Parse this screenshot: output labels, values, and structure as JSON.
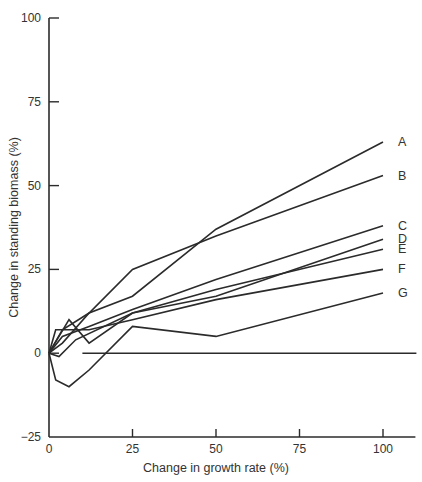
{
  "chart_data": {
    "type": "line",
    "title": "",
    "xlabel": "Change in growth rate (%)",
    "ylabel": "Change in standing biomass (%)",
    "xlim": [
      0,
      110
    ],
    "ylim": [
      -25,
      100
    ],
    "xticks": [
      0,
      25,
      50,
      75,
      100
    ],
    "yticks": [
      -25,
      0,
      25,
      50,
      75,
      100
    ],
    "xtick_labels": [
      "0",
      "25",
      "50",
      "75",
      "100"
    ],
    "ytick_labels": [
      "−25",
      "0",
      "25",
      "50",
      "75",
      "100"
    ],
    "grid": false,
    "legend": "inline-right",
    "series": [
      {
        "name": "A",
        "x": [
          0,
          4,
          12,
          25,
          50,
          100
        ],
        "y": [
          0,
          3,
          12,
          17,
          37,
          63
        ]
      },
      {
        "name": "B",
        "x": [
          0,
          4,
          12,
          25,
          50,
          100
        ],
        "y": [
          0,
          7,
          12,
          25,
          35,
          53
        ]
      },
      {
        "name": "C",
        "x": [
          0,
          4,
          12,
          25,
          50,
          100
        ],
        "y": [
          0,
          5,
          8,
          13,
          22,
          38
        ]
      },
      {
        "name": "D",
        "x": [
          0,
          3,
          8,
          25,
          50,
          100
        ],
        "y": [
          0,
          -1,
          4,
          12,
          17,
          34
        ]
      },
      {
        "name": "E",
        "x": [
          0,
          6,
          12,
          25,
          50,
          100
        ],
        "y": [
          0,
          10,
          3,
          12,
          19,
          31
        ]
      },
      {
        "name": "F",
        "x": [
          0,
          2,
          12,
          25,
          50,
          100
        ],
        "y": [
          0,
          7,
          7,
          10,
          16,
          25
        ]
      },
      {
        "name": "G",
        "x": [
          0,
          2,
          6,
          12,
          25,
          50,
          100
        ],
        "y": [
          0,
          -8,
          -10,
          -5,
          8,
          5,
          18
        ]
      }
    ],
    "reference_line": {
      "name": "zero-baseline",
      "x": [
        10,
        110
      ],
      "y": [
        0,
        0
      ]
    }
  }
}
